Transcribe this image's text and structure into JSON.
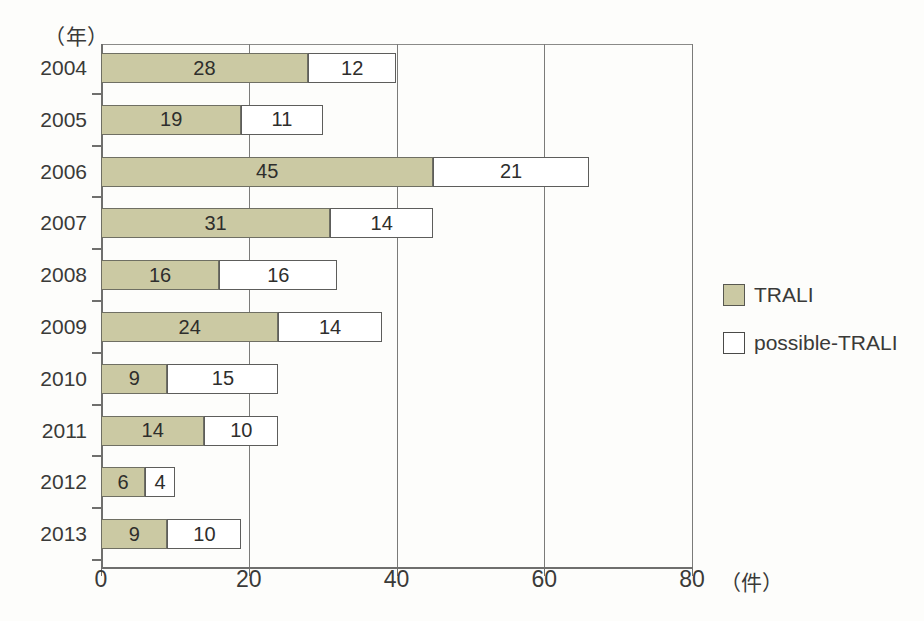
{
  "chart_data": {
    "type": "bar",
    "orientation": "horizontal",
    "stacked": true,
    "title": "",
    "xlabel": "件",
    "ylabel": "年",
    "xlim": [
      0,
      80
    ],
    "xticks": [
      0,
      20,
      40,
      60,
      80
    ],
    "xtick_labels": [
      "0",
      "20",
      "40",
      "60",
      "80"
    ],
    "x_unit_label": "（件）",
    "y_unit_label": "（年）",
    "grid": true,
    "legend_position": "right",
    "categories": [
      "2004",
      "2005",
      "2006",
      "2007",
      "2008",
      "2009",
      "2010",
      "2011",
      "2012",
      "2013"
    ],
    "series": [
      {
        "name": "TRALI",
        "color": "#cbc9a3",
        "values": [
          28,
          19,
          45,
          31,
          16,
          24,
          9,
          14,
          6,
          9
        ]
      },
      {
        "name": "possible-TRALI",
        "color": "#ffffff",
        "values": [
          12,
          11,
          21,
          14,
          16,
          14,
          15,
          10,
          4,
          10
        ]
      }
    ],
    "totals": [
      40,
      30,
      66,
      45,
      32,
      38,
      24,
      24,
      10,
      19
    ]
  },
  "legend": {
    "items": [
      {
        "label": "TRALI",
        "swatch": "olive-filled-square"
      },
      {
        "label": "possible-TRALI",
        "swatch": "white-empty-square"
      }
    ]
  },
  "colors": {
    "series_trali": "#cbc9a3",
    "series_possible_trali": "#ffffff",
    "axis": "#6f6f6d",
    "text": "#3a3a38",
    "background": "#fdfdfb"
  }
}
